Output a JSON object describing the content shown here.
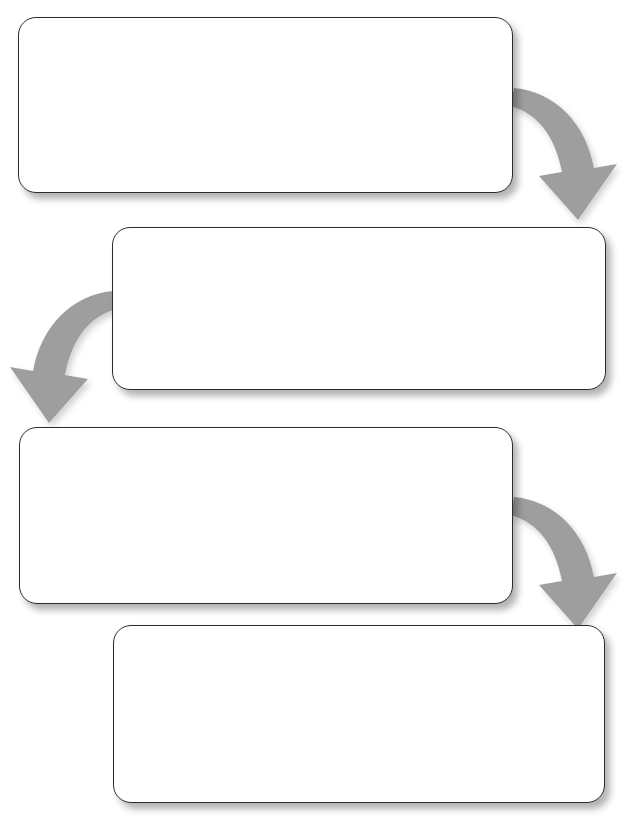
{
  "diagram": {
    "type": "serpentine-flowchart",
    "title": "",
    "orientation": "vertical-serpentine",
    "background_color": "#ffffff",
    "box_fill_color": "#ffffff",
    "box_border_color": "#2b2b2b",
    "arrow_color": "#9e9e9e",
    "shadow_color": "#00000044",
    "box_count": 4,
    "arrow_count": 3,
    "boxes": [
      {
        "id": "box-1",
        "order": "1",
        "text": "",
        "align": "left-offset",
        "x": 18,
        "y": 17,
        "width": 495,
        "height": 176
      },
      {
        "id": "box-2",
        "order": "2",
        "text": "",
        "align": "right-offset",
        "x": 112,
        "y": 227,
        "width": 494,
        "height": 163
      },
      {
        "id": "box-3",
        "order": "3",
        "text": "",
        "align": "left-offset",
        "x": 19,
        "y": 427,
        "width": 494,
        "height": 177
      },
      {
        "id": "box-4",
        "order": "4",
        "text": "",
        "align": "right-offset",
        "x": 113,
        "y": 625,
        "width": 492,
        "height": 178
      }
    ],
    "arrows": [
      {
        "id": "arrow-1",
        "from": "box-1",
        "to": "box-2",
        "direction": "right-down",
        "color": "#9e9e9e"
      },
      {
        "id": "arrow-2",
        "from": "box-2",
        "to": "box-3",
        "direction": "left-down",
        "color": "#9e9e9e"
      },
      {
        "id": "arrow-3",
        "from": "box-3",
        "to": "box-4",
        "direction": "right-down",
        "color": "#9e9e9e"
      }
    ]
  }
}
